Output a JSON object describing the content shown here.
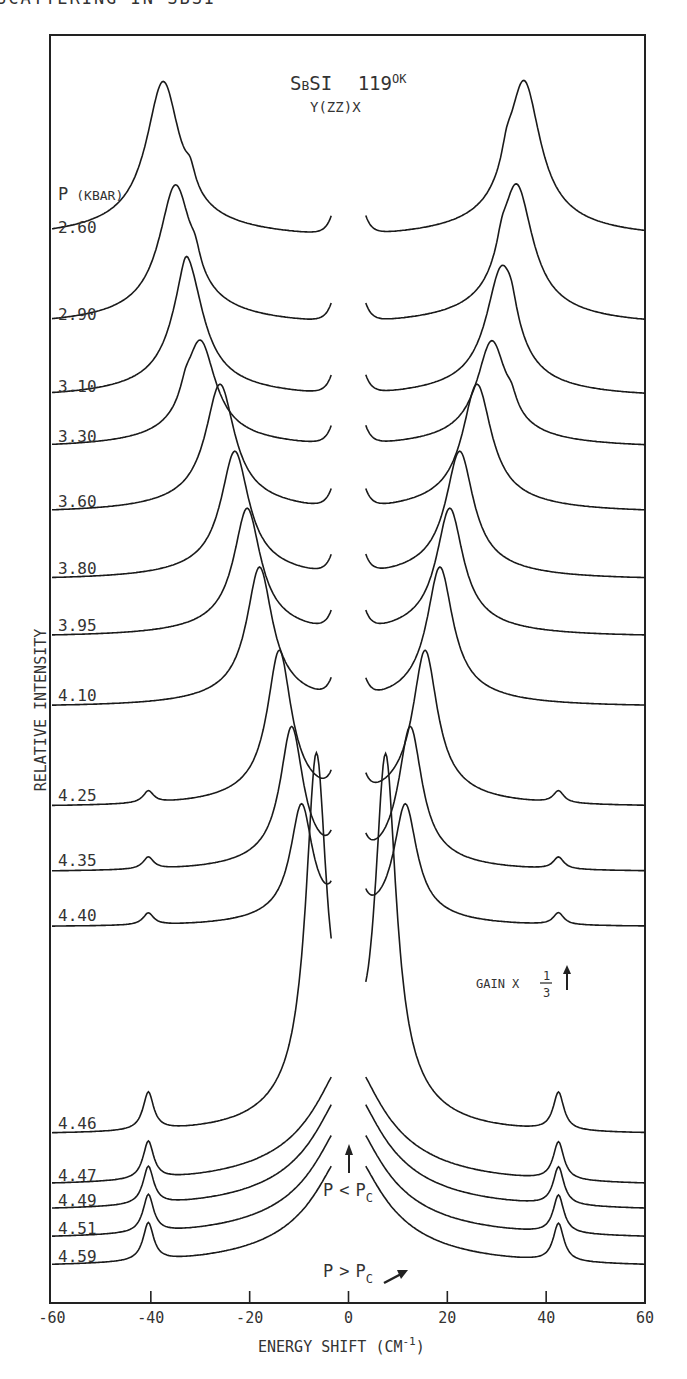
{
  "page": {
    "running_header": "SCATTERING IN SBSI"
  },
  "chart_data": {
    "type": "line",
    "title_parts": {
      "compound_main": "S",
      "compound_small": "B",
      "compound_rest": "SI",
      "temperature": "119",
      "temperature_unit": "OK"
    },
    "subtitle": "Y(ZZ)X",
    "xlabel": "ENERGY SHIFT (CM-1)",
    "xlabel_parts": {
      "text": "ENERGY SHIFT (CM",
      "sup": "-1",
      "close": ")"
    },
    "ylabel": "RELATIVE INTENSITY",
    "xlim": [
      -60,
      60
    ],
    "xticks": [
      -60,
      -40,
      -20,
      0,
      20,
      40,
      60
    ],
    "xtick_labels": [
      "-60",
      "-40",
      "-20",
      "0",
      "20",
      "40",
      "60"
    ],
    "grid": false,
    "legend_header": {
      "p": "P",
      "unit": "(KBAR)"
    },
    "annotations": {
      "gain": {
        "text": "GAIN X",
        "num": "1",
        "den": "3"
      },
      "p_less": {
        "p": "P",
        "op": "<",
        "pc": "P",
        "sub": "C"
      },
      "p_greater": {
        "p": "P",
        "op": ">",
        "pc": "P",
        "sub": "C"
      }
    },
    "series": [
      {
        "name": "2.60",
        "baseline_y": 239,
        "soft_mode_left": -37.5,
        "soft_mode_right": 35.5,
        "soft_height": 140,
        "shoulder": 32,
        "central": false,
        "hard_mode": false
      },
      {
        "name": "2.90",
        "baseline_y": 326,
        "soft_mode_left": -35,
        "soft_mode_right": 34,
        "soft_height": 125,
        "shoulder": 31,
        "central": false,
        "hard_mode": false
      },
      {
        "name": "3.10",
        "baseline_y": 398,
        "soft_mode_left": -32.5,
        "soft_mode_right": 31,
        "soft_height": 115,
        "shoulder": 33,
        "central": false,
        "hard_mode": false
      },
      {
        "name": "3.30",
        "baseline_y": 448,
        "soft_mode_left": -30,
        "soft_mode_right": 29,
        "soft_height": 95,
        "shoulder": 33,
        "central": false,
        "hard_mode": false
      },
      {
        "name": "3.60",
        "baseline_y": 513,
        "soft_mode_left": -26,
        "soft_mode_right": 26,
        "soft_height": 115,
        "shoulder": 0,
        "central": false,
        "hard_mode": false
      },
      {
        "name": "3.80",
        "baseline_y": 580,
        "soft_mode_left": -23,
        "soft_mode_right": 22.5,
        "soft_height": 115,
        "shoulder": 0,
        "central": false,
        "hard_mode": false
      },
      {
        "name": "3.95",
        "baseline_y": 637,
        "soft_mode_left": -20.5,
        "soft_mode_right": 20.5,
        "soft_height": 115,
        "shoulder": 0,
        "central": false,
        "hard_mode": false
      },
      {
        "name": "4.10",
        "baseline_y": 707,
        "soft_mode_left": -18,
        "soft_mode_right": 18.5,
        "soft_height": 125,
        "shoulder": 0,
        "central": false,
        "hard_mode": false
      },
      {
        "name": "4.25",
        "baseline_y": 807,
        "soft_mode_left": -14,
        "soft_mode_right": 15.5,
        "soft_height": 140,
        "shoulder": 0,
        "central": false,
        "hard_mode": true
      },
      {
        "name": "4.35",
        "baseline_y": 872,
        "soft_mode_left": -11.5,
        "soft_mode_right": 12.5,
        "soft_height": 130,
        "shoulder": 0,
        "central": false,
        "hard_mode": true
      },
      {
        "name": "4.40",
        "baseline_y": 927,
        "soft_mode_left": -9.5,
        "soft_mode_right": 11.5,
        "soft_height": 110,
        "shoulder": 0,
        "central": false,
        "hard_mode": true
      },
      {
        "name": "4.46",
        "baseline_y": 1135,
        "soft_mode_left": -6.5,
        "soft_mode_right": 7.5,
        "soft_height": 340,
        "shoulder": 0,
        "central": false,
        "hard_mode": true,
        "gain": "1/3"
      },
      {
        "name": "4.47",
        "baseline_y": 1187,
        "soft_mode_left": 0,
        "soft_mode_right": 0,
        "soft_height": 0,
        "shoulder": 0,
        "central": true,
        "hard_mode": true
      },
      {
        "name": "4.49",
        "baseline_y": 1212,
        "soft_mode_left": 0,
        "soft_mode_right": 0,
        "soft_height": 0,
        "shoulder": 0,
        "central": true,
        "hard_mode": true
      },
      {
        "name": "4.51",
        "baseline_y": 1240,
        "soft_mode_left": 0,
        "soft_mode_right": 0,
        "soft_height": 0,
        "shoulder": 0,
        "central": true,
        "hard_mode": true
      },
      {
        "name": "4.59",
        "baseline_y": 1268,
        "soft_mode_left": 0,
        "soft_mode_right": 0,
        "soft_height": 0,
        "shoulder": 0,
        "central": true,
        "hard_mode": true
      }
    ],
    "hard_mode_positions": [
      -40.5,
      42.5
    ],
    "notch_halfwidth_cm": 3.5
  }
}
